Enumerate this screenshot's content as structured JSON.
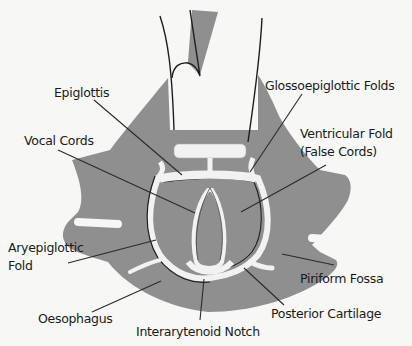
{
  "diagram": {
    "colors": {
      "background": "#f7f7f5",
      "tissue": "#8f8f8f",
      "cartilage": "#f2f2f2",
      "outline": "#1e1e1e",
      "leader_line": "#2a2a2a",
      "label_text": "#1a1a1a"
    },
    "labels": {
      "epiglottis": "Epiglottis",
      "vocal_cords": "Vocal Cords",
      "glossoepiglottic_folds": "Glossoepiglottic Folds",
      "ventricular_fold_line1": "Ventricular Fold",
      "ventricular_fold_line2": "(False Cords)",
      "aryepiglottic_fold_line1": "Aryepiglottic",
      "aryepiglottic_fold_line2": "Fold",
      "piriform_fossa": "Piriform Fossa",
      "oesophagus": "Oesophagus",
      "posterior_cartilage": "Posterior Cartilage",
      "interarytenoid_notch": "Interarytenoid Notch"
    }
  }
}
